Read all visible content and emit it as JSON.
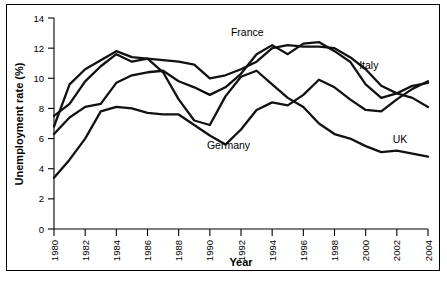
{
  "chart_data": {
    "type": "line",
    "title": "",
    "xlabel": "Year",
    "ylabel": "Unemployment rate (%)",
    "xlim": [
      1980,
      2004
    ],
    "ylim": [
      0,
      14
    ],
    "yticks": [
      0,
      2,
      4,
      6,
      8,
      10,
      12,
      14
    ],
    "xticks": [
      1980,
      1982,
      1984,
      1986,
      1988,
      1990,
      1992,
      1994,
      1996,
      1998,
      2000,
      2002,
      2004
    ],
    "grid": false,
    "legend_position": "inline-labels",
    "x": [
      1980,
      1981,
      1982,
      1983,
      1984,
      1985,
      1986,
      1987,
      1988,
      1989,
      1990,
      1991,
      1992,
      1993,
      1994,
      1995,
      1996,
      1997,
      1998,
      1999,
      2000,
      2001,
      2002,
      2003,
      2004
    ],
    "series": [
      {
        "name": "France",
        "label": "France",
        "values": [
          6.3,
          7.4,
          8.1,
          8.3,
          9.7,
          10.2,
          10.4,
          10.5,
          9.8,
          9.4,
          8.9,
          9.4,
          10.3,
          11.6,
          12.2,
          11.6,
          12.3,
          12.4,
          11.8,
          11.1,
          9.6,
          8.7,
          9.0,
          9.5,
          9.7
        ],
        "annotation_x": 1992.4,
        "annotation_y": 12.8
      },
      {
        "name": "Italy",
        "label": "Italy",
        "values": [
          7.5,
          8.3,
          9.8,
          10.8,
          11.6,
          11.1,
          11.3,
          11.2,
          11.1,
          10.9,
          10.0,
          10.2,
          10.6,
          11.1,
          12.0,
          12.2,
          12.1,
          12.1,
          12.0,
          11.4,
          10.6,
          9.5,
          9.0,
          8.7,
          8.1
        ],
        "annotation_x": 2000.0,
        "annotation_y": 10.5
      },
      {
        "name": "Germany",
        "label": "Germany",
        "values": [
          3.4,
          4.6,
          6.0,
          7.8,
          8.1,
          8.0,
          7.7,
          7.6,
          7.6,
          6.9,
          6.2,
          5.6,
          6.6,
          7.9,
          8.4,
          8.2,
          8.9,
          9.9,
          9.4,
          8.6,
          7.9,
          7.8,
          8.6,
          9.3,
          9.8
        ],
        "annotation_x": 1990.8,
        "annotation_y": 5.4
      },
      {
        "name": "UK",
        "label": "UK",
        "values": [
          6.8,
          9.6,
          10.6,
          11.2,
          11.8,
          11.4,
          11.3,
          10.4,
          8.6,
          7.2,
          6.9,
          8.8,
          10.1,
          10.5,
          9.6,
          8.7,
          8.1,
          7.0,
          6.3,
          6.0,
          5.5,
          5.1,
          5.2,
          5.0,
          4.8
        ],
        "annotation_x": 2002.0,
        "annotation_y": 5.6
      }
    ],
    "annotations": [
      {
        "text": "France",
        "x": 1992.4,
        "y": 12.8
      },
      {
        "text": "Italy",
        "x": 2000.2,
        "y": 10.6
      },
      {
        "text": "Germany",
        "x": 1991.2,
        "y": 5.3
      },
      {
        "text": "UK",
        "x": 2002.2,
        "y": 5.7
      }
    ]
  },
  "caption": ""
}
